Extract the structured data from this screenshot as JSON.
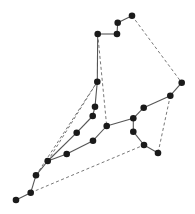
{
  "diagram": {
    "type": "graph",
    "title": "",
    "width": 195,
    "height": 214,
    "colors": {
      "node": "#1a1a1a",
      "solid_edge": "#555555",
      "dashed_edge": "#777777",
      "background": "#ffffff"
    },
    "nodes": [
      {
        "id": "n0",
        "x": 16,
        "y": 200
      },
      {
        "id": "n1",
        "x": 30.7,
        "y": 192.7
      },
      {
        "id": "n2",
        "x": 36,
        "y": 175.3
      },
      {
        "id": "n3",
        "x": 47.7,
        "y": 161
      },
      {
        "id": "n4",
        "x": 66.7,
        "y": 154
      },
      {
        "id": "n5",
        "x": 93,
        "y": 140.7
      },
      {
        "id": "n6",
        "x": 106.7,
        "y": 126
      },
      {
        "id": "n7",
        "x": 133.3,
        "y": 118.3
      },
      {
        "id": "n8",
        "x": 143.7,
        "y": 107.7
      },
      {
        "id": "n9",
        "x": 170.3,
        "y": 95.7
      },
      {
        "id": "n10",
        "x": 181.7,
        "y": 82.7
      },
      {
        "id": "n11",
        "x": 76.7,
        "y": 132.7
      },
      {
        "id": "n12",
        "x": 92.7,
        "y": 116
      },
      {
        "id": "n13",
        "x": 95,
        "y": 106.7
      },
      {
        "id": "n14",
        "x": 97.3,
        "y": 81.7
      },
      {
        "id": "n15",
        "x": 97.7,
        "y": 34
      },
      {
        "id": "n16",
        "x": 117,
        "y": 34
      },
      {
        "id": "n17",
        "x": 117.7,
        "y": 22.7
      },
      {
        "id": "n18",
        "x": 132,
        "y": 15.7
      },
      {
        "id": "n19",
        "x": 133.3,
        "y": 131.7
      },
      {
        "id": "n20",
        "x": 144,
        "y": 145
      },
      {
        "id": "n21",
        "x": 158,
        "y": 153
      }
    ],
    "solid_edges": [
      [
        "n0",
        "n1"
      ],
      [
        "n1",
        "n2"
      ],
      [
        "n2",
        "n3"
      ],
      [
        "n3",
        "n4"
      ],
      [
        "n4",
        "n5"
      ],
      [
        "n5",
        "n6"
      ],
      [
        "n6",
        "n7"
      ],
      [
        "n7",
        "n8"
      ],
      [
        "n8",
        "n9"
      ],
      [
        "n9",
        "n10"
      ],
      [
        "n3",
        "n11"
      ],
      [
        "n11",
        "n12"
      ],
      [
        "n12",
        "n13"
      ],
      [
        "n13",
        "n14"
      ],
      [
        "n14",
        "n15"
      ],
      [
        "n15",
        "n16"
      ],
      [
        "n16",
        "n17"
      ],
      [
        "n17",
        "n18"
      ],
      [
        "n7",
        "n19"
      ],
      [
        "n19",
        "n20"
      ],
      [
        "n20",
        "n21"
      ]
    ],
    "dashed_edges": [
      [
        "n2",
        "n14"
      ],
      [
        "n3",
        "n14"
      ],
      [
        "n15",
        "n6"
      ],
      [
        "n18",
        "n10"
      ],
      [
        "n9",
        "n21"
      ],
      [
        "n1",
        "n20"
      ]
    ]
  }
}
